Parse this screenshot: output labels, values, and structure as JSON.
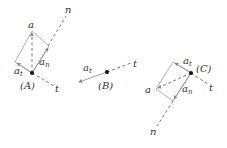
{
  "diagram": {
    "panels": [
      {
        "id": "A",
        "point_label": "(A)",
        "normal_label": "n",
        "tangent_label": "t",
        "accel_label": "a",
        "tangential_label": "a",
        "tangential_sub": "t",
        "normal_comp_label": "a",
        "normal_comp_sub": "n"
      },
      {
        "id": "B",
        "point_label": "(B)",
        "tangent_label": "t",
        "tangential_label": "a",
        "tangential_sub": "t"
      },
      {
        "id": "C",
        "point_label": "(C)",
        "normal_label": "n",
        "tangent_label": "t",
        "accel_label": "a",
        "tangential_label": "a",
        "tangential_sub": "t",
        "normal_comp_label": "a",
        "normal_comp_sub": "n"
      }
    ]
  }
}
